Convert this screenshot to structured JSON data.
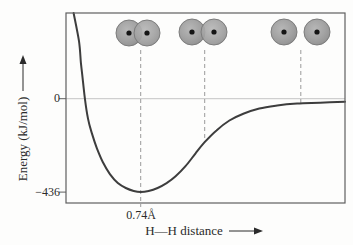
{
  "figure": {
    "y_axis_label": "Energy (kJ/mol)",
    "x_axis_label": "H—H distance",
    "y_tick_zero": "0",
    "y_tick_min": "−436",
    "min_distance_label": "0.74Å"
  },
  "colors": {
    "curve": "#3d3d3d",
    "axis_box": "#5f5f5f",
    "zero_line": "#c4c4c4",
    "dashed_guide": "#9a9a9a",
    "atom_fill": "#a4a4a4",
    "atom_rim": "#7c7c7c",
    "nucleus": "#151515",
    "text": "#2b2b2b",
    "background": "#fdfdfc"
  },
  "chart_data": {
    "type": "line",
    "xlabel": "H—H distance",
    "ylabel": "Energy (kJ/mol)",
    "grid": false,
    "legend": false,
    "x_range": [
      0.25,
      2.08
    ],
    "y_range": [
      -487,
      400
    ],
    "yticks": [
      {
        "label": "0",
        "value": 0
      },
      {
        "label": "−436",
        "value": -436
      }
    ],
    "asymptote_y": 0,
    "minimum": {
      "x": 0.74,
      "y": -436,
      "label": "0.74Å"
    },
    "series": [
      {
        "name": "H–H potential energy",
        "points": [
          [
            0.3,
            400
          ],
          [
            0.335,
            269
          ],
          [
            0.348,
            167
          ],
          [
            0.361,
            83
          ],
          [
            0.374,
            0
          ],
          [
            0.394,
            -93
          ],
          [
            0.42,
            -162
          ],
          [
            0.453,
            -232
          ],
          [
            0.492,
            -297
          ],
          [
            0.538,
            -352
          ],
          [
            0.59,
            -394
          ],
          [
            0.642,
            -417
          ],
          [
            0.694,
            -431
          ],
          [
            0.74,
            -436
          ],
          [
            0.792,
            -431
          ],
          [
            0.851,
            -417
          ],
          [
            0.91,
            -394
          ],
          [
            0.969,
            -362
          ],
          [
            1.034,
            -315
          ],
          [
            1.1,
            -255
          ],
          [
            1.158,
            -204
          ],
          [
            1.237,
            -148
          ],
          [
            1.322,
            -102
          ],
          [
            1.413,
            -70
          ],
          [
            1.518,
            -46
          ],
          [
            1.635,
            -32
          ],
          [
            1.766,
            -23
          ],
          [
            1.917,
            -19
          ],
          [
            2.08,
            -14
          ]
        ]
      }
    ],
    "dashed_guides": [
      {
        "x": 0.74,
        "drop_to": "axis",
        "illustration": "h2-bonded-overlapping-atoms"
      },
      {
        "x": 1.16,
        "drop_to": "curve",
        "illustration": "h2-partially-overlapping-atoms"
      },
      {
        "x": 1.79,
        "drop_to": "curve",
        "illustration": "h2-separated-atoms"
      }
    ]
  }
}
